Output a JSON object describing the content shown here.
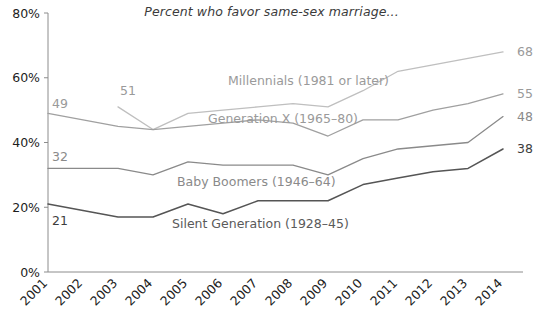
{
  "chart_data": {
    "type": "line",
    "title": "Percent who favor same-sex marriage...",
    "xlabel": "",
    "ylabel": "",
    "ylim": [
      0,
      80
    ],
    "ytick_labels": [
      "0%",
      "20%",
      "40%",
      "60%",
      "80%"
    ],
    "ytick_values": [
      0,
      20,
      40,
      60,
      80
    ],
    "grid": false,
    "legend_position": "inline-labels",
    "x": [
      2001,
      2002,
      2003,
      2004,
      2005,
      2006,
      2007,
      2008,
      2009,
      2010,
      2011,
      2012,
      2013,
      2014
    ],
    "categories": [
      "2001",
      "2002",
      "2003",
      "2004",
      "2005",
      "2006",
      "2007",
      "2008",
      "2009",
      "2010",
      "2011",
      "2012",
      "2013",
      "2014"
    ],
    "series": [
      {
        "name": "Millennials (1981 or later)",
        "label": "Millennials (1981 or later)",
        "color": "#bfbfbf",
        "start_label": "51",
        "end_label": "68",
        "x": [
          2003,
          2004,
          2005,
          2006,
          2007,
          2008,
          2009,
          2010,
          2011,
          2012,
          2013,
          2014
        ],
        "values": [
          51,
          44,
          49,
          50,
          51,
          52,
          51,
          56,
          62,
          64,
          66,
          68
        ]
      },
      {
        "name": "Generation X (1965-80)",
        "label": "Generation X (1965–80)",
        "color": "#a0a0a0",
        "start_label": "49",
        "end_label": "55",
        "x": [
          2001,
          2002,
          2003,
          2004,
          2005,
          2006,
          2007,
          2008,
          2009,
          2010,
          2011,
          2012,
          2013,
          2014
        ],
        "values": [
          49,
          47,
          45,
          44,
          45,
          46,
          47,
          46,
          42,
          47,
          47,
          50,
          52,
          55
        ]
      },
      {
        "name": "Baby Boomers (1946-64)",
        "label": "Baby Boomers (1946–64)",
        "color": "#8a8a8a",
        "start_label": "32",
        "end_label": "48",
        "x": [
          2001,
          2002,
          2003,
          2004,
          2005,
          2006,
          2007,
          2008,
          2009,
          2010,
          2011,
          2012,
          2013,
          2014
        ],
        "values": [
          32,
          32,
          32,
          30,
          34,
          33,
          33,
          33,
          30,
          35,
          38,
          39,
          40,
          48
        ]
      },
      {
        "name": "Silent Generation (1928-45)",
        "label": "Silent Generation (1928–45)",
        "color": "#555555",
        "start_label": "21",
        "end_label": "38",
        "x": [
          2001,
          2002,
          2003,
          2004,
          2005,
          2006,
          2007,
          2008,
          2009,
          2010,
          2011,
          2012,
          2013,
          2014
        ],
        "values": [
          21,
          19,
          17,
          17,
          21,
          18,
          22,
          22,
          22,
          27,
          29,
          31,
          32,
          38
        ]
      }
    ],
    "annotations": [
      {
        "name": "millennials-start-value",
        "text": "51"
      },
      {
        "name": "genx-start-value",
        "text": "49"
      },
      {
        "name": "boomers-start-value",
        "text": "32"
      },
      {
        "name": "silent-start-value",
        "text": "21"
      },
      {
        "name": "millennials-end-value",
        "text": "68"
      },
      {
        "name": "genx-end-value",
        "text": "55"
      },
      {
        "name": "boomers-end-value",
        "text": "48"
      },
      {
        "name": "silent-end-value",
        "text": "38"
      }
    ]
  }
}
